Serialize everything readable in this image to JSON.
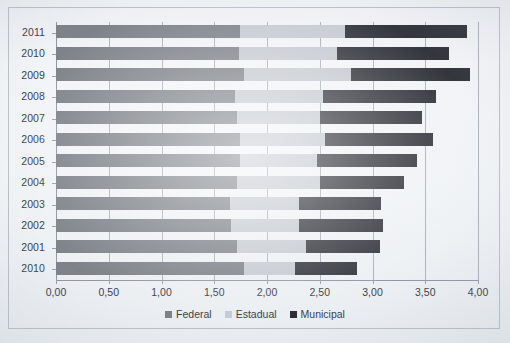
{
  "chart_data": {
    "type": "bar",
    "orientation": "horizontal",
    "stacked": true,
    "title": "",
    "subtitle": "",
    "xlabel": "",
    "ylabel": "",
    "xlim": [
      0,
      4
    ],
    "xticks": [
      0,
      0.5,
      1,
      1.5,
      2,
      2.5,
      3,
      3.5,
      4
    ],
    "xtick_labels": [
      "0,00",
      "0,50",
      "1,00",
      "1,50",
      "2,00",
      "2,50",
      "3,00",
      "3,50",
      "4,00"
    ],
    "decimal_separator": ",",
    "grid": "vertical",
    "legend_position": "bottom-center",
    "categories": [
      "2011",
      "2010",
      "2009",
      "2008",
      "2007",
      "2006",
      "2005",
      "2004",
      "2003",
      "2002",
      "2001",
      "2010"
    ],
    "series": [
      {
        "name": "Federal",
        "color": "#7d8289",
        "values": [
          1.74,
          1.73,
          1.78,
          1.7,
          1.72,
          1.74,
          1.74,
          1.72,
          1.65,
          1.66,
          1.72,
          1.78
        ]
      },
      {
        "name": "Estadual",
        "color": "#c5cad1",
        "values": [
          1.0,
          0.93,
          1.02,
          0.83,
          0.78,
          0.81,
          0.73,
          0.78,
          0.65,
          0.64,
          0.65,
          0.49
        ]
      },
      {
        "name": "Municipal",
        "color": "#33363d",
        "values": [
          1.16,
          1.07,
          1.12,
          1.07,
          0.97,
          1.02,
          0.95,
          0.8,
          0.78,
          0.8,
          0.7,
          0.58
        ]
      }
    ],
    "totals": [
      3.9,
      3.73,
      3.92,
      3.6,
      3.47,
      3.57,
      3.42,
      3.3,
      3.08,
      3.1,
      3.07,
      2.85
    ]
  },
  "legend": {
    "items": [
      {
        "label": "Federal",
        "key": "federal"
      },
      {
        "label": "Estadual",
        "key": "estadual"
      },
      {
        "label": "Municipal",
        "key": "municipal"
      }
    ]
  }
}
